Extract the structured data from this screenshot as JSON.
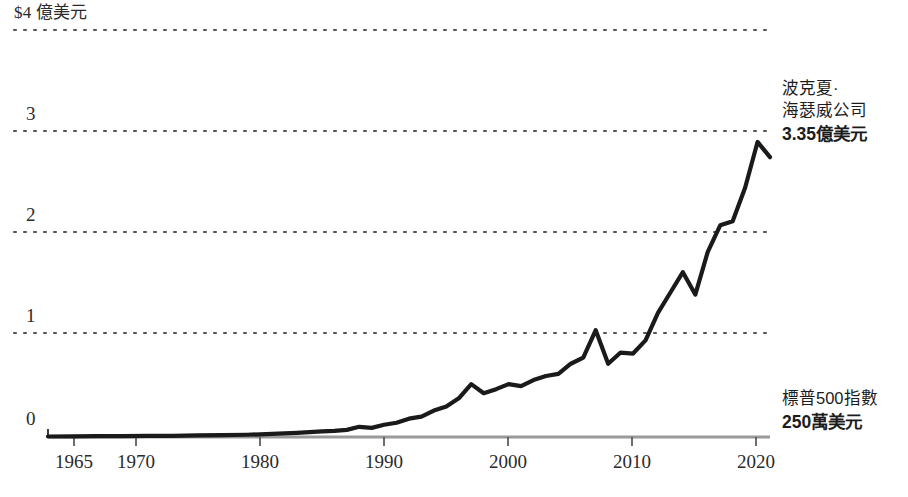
{
  "chart_data": {
    "type": "line",
    "title": "",
    "subtitle": "",
    "xlabel": "",
    "ylabel": "",
    "y_unit_label": "$4 億美元",
    "grid": true,
    "grid_style": "dotted-horizontal",
    "legend": "inline-annotations",
    "xlim": [
      1964,
      2022
    ],
    "ylim": [
      0,
      4
    ],
    "x_ticks": [
      "1965",
      "1970",
      "1980",
      "1990",
      "2000",
      "2010",
      "2020"
    ],
    "x_tick_values": [
      1965,
      1970,
      1980,
      1990,
      2000,
      2010,
      2020
    ],
    "y_ticks": [
      "0",
      "1",
      "2",
      "3",
      "$4 億美元"
    ],
    "y_tick_values": [
      0,
      1,
      2,
      3,
      4
    ],
    "series": [
      {
        "name": "波克夏·海瑟威公司",
        "annotation_line1": "波克夏·",
        "annotation_line2": "海瑟威公司",
        "value_label": "3.35億美元",
        "final_value": 3.35,
        "color": "#1a1a1a",
        "x": [
          1964,
          1966,
          1968,
          1970,
          1972,
          1974,
          1976,
          1978,
          1980,
          1982,
          1984,
          1986,
          1987,
          1988,
          1989,
          1990,
          1991,
          1992,
          1993,
          1994,
          1995,
          1996,
          1997,
          1998,
          1999,
          2000,
          2001,
          2002,
          2003,
          2004,
          2005,
          2006,
          2007,
          2008,
          2009,
          2010,
          2011,
          2012,
          2013,
          2014,
          2015,
          2016,
          2017,
          2018,
          2019,
          2020,
          2021,
          2022
        ],
        "y": [
          0.005,
          0.006,
          0.008,
          0.009,
          0.011,
          0.012,
          0.015,
          0.018,
          0.022,
          0.03,
          0.04,
          0.055,
          0.06,
          0.07,
          0.1,
          0.09,
          0.12,
          0.14,
          0.18,
          0.2,
          0.26,
          0.3,
          0.38,
          0.52,
          0.43,
          0.47,
          0.52,
          0.5,
          0.56,
          0.6,
          0.62,
          0.72,
          0.78,
          1.05,
          0.72,
          0.83,
          0.82,
          0.95,
          1.22,
          1.42,
          1.62,
          1.4,
          1.82,
          2.08,
          2.12,
          2.45,
          2.9,
          2.75
        ]
      },
      {
        "name": "標普500指數",
        "annotation_line1": "標普500指數",
        "value_label": "250萬美元",
        "final_value": 0.025,
        "color": "#9a9a9a"
      }
    ]
  },
  "axes": {
    "y_labels": [
      {
        "text": "$4 億美元",
        "value": 4
      },
      {
        "text": "3",
        "value": 3
      },
      {
        "text": "2",
        "value": 2
      },
      {
        "text": "1",
        "value": 1
      },
      {
        "text": "0",
        "value": 0
      }
    ],
    "x_labels": [
      {
        "text": "1965",
        "value": 1965
      },
      {
        "text": "1970",
        "value": 1970
      },
      {
        "text": "1980",
        "value": 1980
      },
      {
        "text": "1990",
        "value": 1990
      },
      {
        "text": "2000",
        "value": 2000
      },
      {
        "text": "2010",
        "value": 2010
      },
      {
        "text": "2020",
        "value": 2020
      }
    ]
  },
  "annotations": {
    "berkshire": {
      "line1": "波克夏·",
      "line2": "海瑟威公司",
      "value": "3.35億美元"
    },
    "sp500": {
      "line1": "標普500指數",
      "value": "250萬美元"
    }
  },
  "colors": {
    "berkshire_line": "#1a1a1a",
    "sp500_line": "#9a9a9a",
    "gridline": "#555555",
    "text": "#2b2b2b",
    "background": "#ffffff"
  }
}
